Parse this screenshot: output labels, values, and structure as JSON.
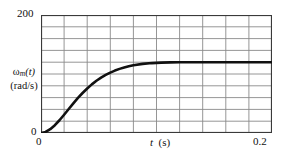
{
  "chart_data": {
    "type": "line",
    "title": "",
    "xlabel": "t  (s)",
    "ylabel": "ωm(t) (rad/s)",
    "ylabel_main": "ω",
    "ylabel_sub": "m",
    "ylabel_var": "(t)",
    "ylabel_units": "(rad/s)",
    "xlabel_var": "t",
    "xlabel_units": "(s)",
    "xlim": [
      0,
      0.2
    ],
    "ylim": [
      0,
      200
    ],
    "x_ticks": [
      0,
      0.02,
      0.04,
      0.06,
      0.08,
      0.1,
      0.12,
      0.14,
      0.16,
      0.18,
      0.2
    ],
    "y_ticks": [
      0,
      20,
      40,
      60,
      80,
      100,
      120,
      140,
      160,
      180,
      200
    ],
    "x_tick_labels": [
      "0",
      "0.2"
    ],
    "y_tick_labels": [
      "0",
      "200"
    ],
    "grid": true,
    "grid_color": "#8a8a8a",
    "frame_color": "#3a3a3a",
    "legend": "none",
    "series": [
      {
        "name": "ωm(t)",
        "color": "#111111",
        "line_width": 2.6,
        "steady_state": 120,
        "x": [
          0,
          0.004,
          0.008,
          0.012,
          0.016,
          0.02,
          0.024,
          0.028,
          0.032,
          0.036,
          0.04,
          0.044,
          0.048,
          0.052,
          0.056,
          0.06,
          0.064,
          0.068,
          0.072,
          0.076,
          0.08,
          0.088,
          0.096,
          0.104,
          0.112,
          0.12,
          0.13,
          0.14,
          0.15,
          0.16,
          0.17,
          0.18,
          0.19,
          0.2
        ],
        "y": [
          0,
          1.8,
          6.4,
          13.2,
          21.6,
          31.0,
          40.7,
          50.3,
          59.4,
          67.8,
          75.5,
          82.4,
          88.5,
          93.8,
          98.4,
          102.4,
          105.8,
          108.7,
          111.1,
          113.1,
          114.8,
          117.1,
          118.5,
          119.3,
          119.7,
          119.9,
          120.0,
          120.0,
          120.0,
          120.0,
          120.0,
          120.0,
          120.0,
          120.0
        ]
      }
    ]
  }
}
